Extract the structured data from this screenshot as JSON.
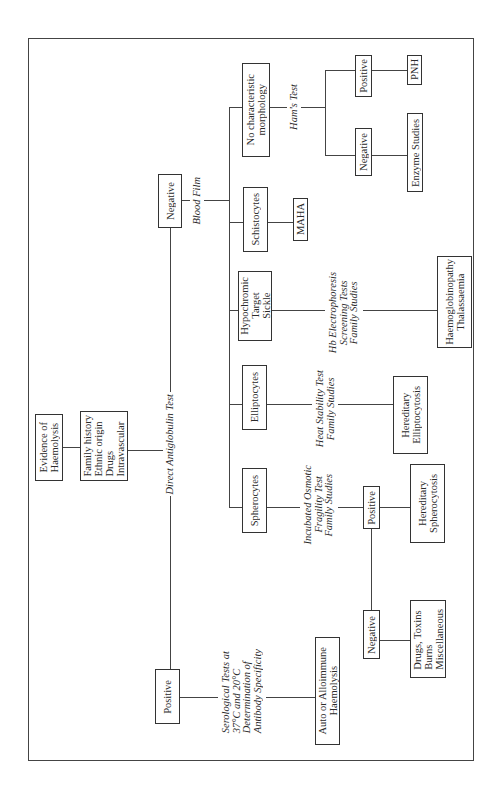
{
  "diagram": {
    "nodes": {
      "evidence": "Evidence of\nHaemolysis",
      "history": "Family history\nEthnic origin\nDrugs\nIntravascular",
      "dat_negative": "Negative",
      "dat_positive": "Positive",
      "no_morphology": "No characteristic\nmorphology",
      "schistocytes": "Schistocytes",
      "hypochromic": "Hypochromic\nTarget\nSickle",
      "elliptocytes": "Elliptocytes",
      "spherocytes": "Spherocytes",
      "ham_positive": "Positive",
      "ham_negative": "Negative",
      "pnh": "PNH",
      "enzyme": "Enzyme Studies",
      "maha": "MAHA",
      "haemoglobinopathy": "Haemoglobinopathy\nThalassaemia",
      "her_ellipto": "Hereditary\nElliptocytosis",
      "osm_positive": "Positive",
      "osm_negative": "Negative",
      "her_sphero": "Hereditary\nSpherocytosis",
      "drugs": "Drugs, Toxins\nBurns\nMiscellaneous",
      "autoimmune": "Auto or Alloimmune\nHaemolysis"
    },
    "edge_labels": {
      "dat": "Direct Antiglobulin Test",
      "blood_film": "Blood Film",
      "hams": "Ham's Test",
      "hb": "Hb Electrophoresis\nScreening Tests\nFamily Studies",
      "heat": "Heat Stability Test\nFamily Studies",
      "osmotic": "Incubated Osmotic\nFragility Test\nFamily Studies",
      "serological": "Serological Tests at\n37°C and 20°C\nDetermination of\nAntibody Specificity"
    }
  }
}
